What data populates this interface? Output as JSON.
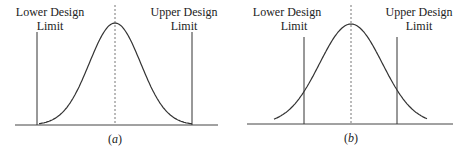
{
  "figure": {
    "panels": [
      {
        "id": "a",
        "caption": "a",
        "lower_label_line1": "Lower Design",
        "lower_label_line2": "Limit",
        "upper_label_line1": "Upper Design",
        "upper_label_line2": "Limit",
        "description": "Distribution fits entirely within design limits",
        "spread_sigma_vs_limits": 3.0
      },
      {
        "id": "b",
        "caption": "b",
        "lower_label_line1": "Lower Design",
        "lower_label_line2": "Limit",
        "upper_label_line1": "Upper Design",
        "upper_label_line2": "Limit",
        "description": "Distribution tails extend beyond design limits",
        "spread_sigma_vs_limits": 1.5
      }
    ]
  }
}
